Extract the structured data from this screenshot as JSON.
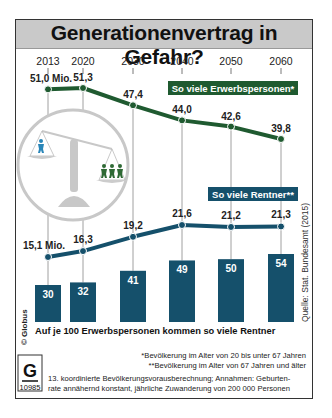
{
  "title": "Generationenvertrag in Gefahr?",
  "colors": {
    "workers": "#1f5a30",
    "retirees": "#15506b",
    "title_band": "#c9c9c9",
    "scale": "#c8c8c8"
  },
  "legend": {
    "workers_label": "So viele Erwerbspersonen*",
    "retirees_label": "So viele Rentner**"
  },
  "bars_caption": "Auf je 100 Erwerbspersonen kommen so viele Rentner",
  "source": "Quelle: Stat. Bundesamt (2015)",
  "copyright": "© Globus",
  "logo": {
    "letter": "G",
    "number": "10985"
  },
  "footnotes": {
    "f1": "*Bevölkerung im Alter von 20 bis unter 67 Jahren",
    "f2": "**Bevölkerung im Alter von 67 Jahren und älter",
    "f3": "13. koordinierte Bevölkerungsvorausberechnung; Annahmen: Geburten-",
    "f4": "rate annähernd konstant, jährliche Zuwanderung von 200 000 Personen"
  },
  "chart_data": {
    "type": "line",
    "title": "Generationenvertrag in Gefahr?",
    "x": [
      "2013",
      "2020",
      "2030",
      "2040",
      "2050",
      "2060"
    ],
    "series": [
      {
        "name": "So viele Erwerbspersonen*",
        "unit": "Mio.",
        "values": [
          51.0,
          51.3,
          47.4,
          44.0,
          42.6,
          39.8
        ],
        "labels": [
          "51,0 Mio.",
          "51,3",
          "47,4",
          "44,0",
          "42,6",
          "39,8"
        ]
      },
      {
        "name": "So viele Rentner**",
        "unit": "Mio.",
        "values": [
          15.1,
          16.3,
          19.2,
          21.6,
          21.2,
          21.3
        ],
        "labels": [
          "15,1 Mio.",
          "16,3",
          "19,2",
          "21,6",
          "21,2",
          "21,3"
        ]
      },
      {
        "name": "Auf je 100 Erwerbspersonen kommen so viele Rentner",
        "type": "bar",
        "values": [
          30,
          32,
          41,
          49,
          50,
          54
        ],
        "labels": [
          "30",
          "32",
          "41",
          "49",
          "50",
          "54"
        ]
      }
    ],
    "xlabel": "",
    "ylabel": "",
    "grid": false,
    "legend_position": "inline labels"
  }
}
